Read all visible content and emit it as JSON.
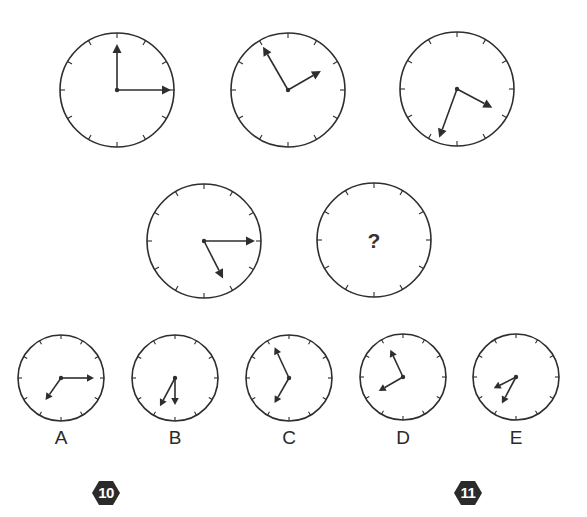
{
  "puzzle": {
    "question_mark": "?",
    "stroke_color": "#2e2e2e",
    "sequence": [
      {
        "id": "clock-1",
        "cx": 117,
        "cy": 90,
        "r": 57,
        "hands": [
          {
            "angle": 0,
            "len": 46
          },
          {
            "angle": 90,
            "len": 54
          }
        ]
      },
      {
        "id": "clock-2",
        "cx": 288,
        "cy": 90,
        "r": 57,
        "hands": [
          {
            "angle": 330,
            "len": 50
          },
          {
            "angle": 60,
            "len": 38
          }
        ]
      },
      {
        "id": "clock-3",
        "cx": 457,
        "cy": 89,
        "r": 57,
        "hands": [
          {
            "angle": 118,
            "len": 40
          },
          {
            "angle": 200,
            "len": 52
          }
        ]
      },
      {
        "id": "clock-4",
        "cx": 204,
        "cy": 241,
        "r": 57,
        "hands": [
          {
            "angle": 90,
            "len": 51
          },
          {
            "angle": 153,
            "len": 42
          }
        ]
      },
      {
        "id": "clock-5-unknown",
        "cx": 374,
        "cy": 240,
        "r": 57,
        "hands": [],
        "unknown": true
      }
    ],
    "options": [
      {
        "label": "A",
        "cx": 61,
        "cy": 378,
        "r": 43,
        "hands": [
          {
            "angle": 90,
            "len": 33
          },
          {
            "angle": 215,
            "len": 27
          }
        ]
      },
      {
        "label": "B",
        "cx": 175,
        "cy": 378,
        "r": 43,
        "hands": [
          {
            "angle": 180,
            "len": 27
          },
          {
            "angle": 208,
            "len": 32
          }
        ]
      },
      {
        "label": "C",
        "cx": 289,
        "cy": 378,
        "r": 43,
        "hands": [
          {
            "angle": 335,
            "len": 34
          },
          {
            "angle": 210,
            "len": 29
          }
        ]
      },
      {
        "label": "D",
        "cx": 403,
        "cy": 377,
        "r": 43,
        "hands": [
          {
            "angle": 335,
            "len": 30
          },
          {
            "angle": 240,
            "len": 28
          }
        ]
      },
      {
        "label": "E",
        "cx": 516,
        "cy": 377,
        "r": 43,
        "hands": [
          {
            "angle": 243,
            "len": 25
          },
          {
            "angle": 208,
            "len": 30
          }
        ]
      }
    ]
  },
  "badges": [
    {
      "number": "10",
      "x": 91,
      "y": 480
    },
    {
      "number": "11",
      "x": 453,
      "y": 480
    }
  ]
}
